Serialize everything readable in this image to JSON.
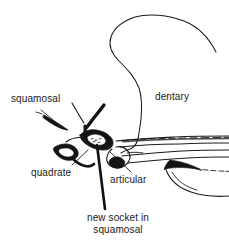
{
  "figure": {
    "width": 229,
    "height": 246,
    "background_color": "#ffffff",
    "ink_color": "#1a1a1a"
  },
  "labels": {
    "squamosal": "squamosal",
    "dentary": "dentary",
    "quadrate": "quadrate",
    "articular": "articular",
    "new_socket_line1": "new socket in",
    "new_socket_line2": "squamosal"
  },
  "diagram_data": {
    "type": "line-drawing",
    "subject": "mammal-like reptile jaw joint, lateral view",
    "stroke_color": "#1a1a1a",
    "fill_color": "#111111",
    "structures": [
      {
        "name": "squamosal",
        "description": "dark tapering bone spur angled down and to the right, upper left of joint",
        "label": "squamosal",
        "label_position": {
          "x": 11,
          "y": 93
        },
        "leader": {
          "from": {
            "x": 41,
            "y": 110
          },
          "to": {
            "x": 62,
            "y": 128
          }
        }
      },
      {
        "name": "quadrate",
        "description": "small dark blocky bone below and left of the joint",
        "label": "quadrate",
        "label_position": {
          "x": 31,
          "y": 167
        },
        "leader": {
          "from": {
            "x": 72,
            "y": 165
          },
          "to": {
            "x": 88,
            "y": 150
          }
        }
      },
      {
        "name": "articular",
        "description": "small dark hook-shaped bone at the rear of the lower jaw",
        "label": "articular",
        "label_position": {
          "x": 110,
          "y": 174
        },
        "leader": {
          "from": {
            "x": 131,
            "y": 172
          },
          "to": {
            "x": 110,
            "y": 152
          }
        }
      },
      {
        "name": "dentary",
        "description": "large tooth-bearing lower jaw bone with tall arching coronoid process",
        "label": "dentary",
        "label_position": {
          "x": 155,
          "y": 91
        },
        "leader": null
      },
      {
        "name": "new socket in squamosal",
        "description": "new dentary-squamosal contact indicated by a heavy straight pointer line",
        "label": "new socket in squamosal",
        "label_position": {
          "x": 63,
          "y": 212
        },
        "leader": {
          "from": {
            "x": 105,
            "y": 209
          },
          "to": {
            "x": 97,
            "y": 145
          }
        }
      }
    ]
  }
}
